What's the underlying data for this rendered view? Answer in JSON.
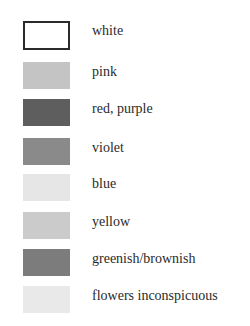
{
  "legend": {
    "items": [
      {
        "label": "white",
        "color": "#ffffff",
        "outlined": true,
        "top": 21
      },
      {
        "label": "pink",
        "color": "#c4c4c4",
        "outlined": false,
        "top": 62
      },
      {
        "label": "red, purple",
        "color": "#5e5e5e",
        "outlined": false,
        "top": 99
      },
      {
        "label": "violet",
        "color": "#8a8a8a",
        "outlined": false,
        "top": 138
      },
      {
        "label": "blue",
        "color": "#e6e6e6",
        "outlined": false,
        "top": 174
      },
      {
        "label": "yellow",
        "color": "#cbcbcb",
        "outlined": false,
        "top": 212
      },
      {
        "label": "greenish/brownish",
        "color": "#7c7c7c",
        "outlined": false,
        "top": 249
      },
      {
        "label": "flowers inconspicuous",
        "color": "#e9e9e9",
        "outlined": false,
        "top": 286
      }
    ]
  }
}
